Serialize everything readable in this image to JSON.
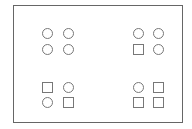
{
  "diagram": {
    "colors": {
      "stroke": "#777777",
      "frame": "#666666",
      "background": "#ffffff"
    },
    "groups": [
      {
        "name": "top-left",
        "shapes": [
          "circle",
          "circle",
          "circle",
          "circle"
        ]
      },
      {
        "name": "top-right",
        "shapes": [
          "circle",
          "circle",
          "square",
          "circle"
        ]
      },
      {
        "name": "bottom-left",
        "shapes": [
          "square",
          "circle",
          "circle",
          "square"
        ]
      },
      {
        "name": "bottom-right",
        "shapes": [
          "circle",
          "square",
          "square",
          "square"
        ]
      }
    ]
  }
}
